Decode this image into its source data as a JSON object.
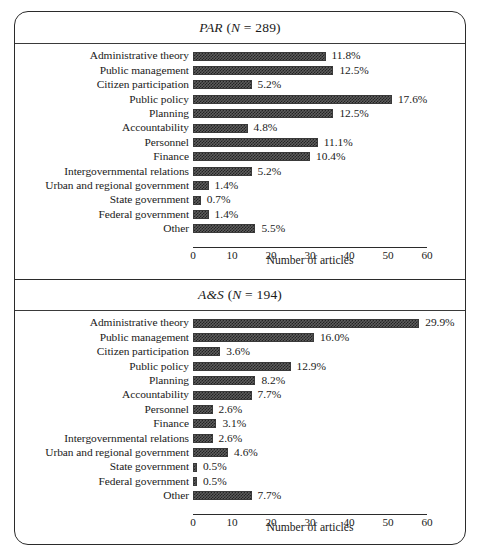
{
  "figure": {
    "background_color": "#ffffff",
    "frame_color": "#2b2b2b",
    "bar_fill_color": "#4a4a4a"
  },
  "panels": [
    {
      "id": "par",
      "title_main": "PAR",
      "title_n": "(N = 289)",
      "axis_title": "Number of articles",
      "tick_labels": [
        "0",
        "10",
        "20",
        "30",
        "40",
        "50",
        "60"
      ]
    },
    {
      "id": "aas",
      "title_main": "A&S",
      "title_n": "(N = 194)",
      "axis_title": "Number of articles",
      "tick_labels": [
        "0",
        "10",
        "20",
        "30",
        "40",
        "50",
        "60"
      ]
    }
  ],
  "chart_data": [
    {
      "type": "bar",
      "orientation": "horizontal",
      "title": "PAR (N = 289)",
      "subtitle": "",
      "xlabel": "Number of articles",
      "ylabel": "",
      "xlim": [
        0,
        60
      ],
      "xticks": [
        0,
        10,
        20,
        30,
        40,
        50,
        60
      ],
      "grid": false,
      "legend": "none",
      "n_total": 289,
      "categories": [
        "Administrative theory",
        "Public management",
        "Citizen participation",
        "Public policy",
        "Planning",
        "Accountability",
        "Personnel",
        "Finance",
        "Intergovernmental relations",
        "Urban and regional government",
        "State government",
        "Federal government",
        "Other"
      ],
      "values": [
        34,
        36,
        15,
        51,
        36,
        14,
        32,
        30,
        15,
        4,
        2,
        4,
        16
      ],
      "data_labels": [
        "11.8%",
        "12.5%",
        "5.2%",
        "17.6%",
        "12.5%",
        "4.8%",
        "11.1%",
        "10.4%",
        "5.2%",
        "1.4%",
        "0.7%",
        "1.4%",
        "5.5%"
      ],
      "percentages": [
        11.8,
        12.5,
        5.2,
        17.6,
        12.5,
        4.8,
        11.1,
        10.4,
        5.2,
        1.4,
        0.7,
        1.4,
        5.5
      ]
    },
    {
      "type": "bar",
      "orientation": "horizontal",
      "title": "A&S (N = 194)",
      "subtitle": "",
      "xlabel": "Number of articles",
      "ylabel": "",
      "xlim": [
        0,
        60
      ],
      "xticks": [
        0,
        10,
        20,
        30,
        40,
        50,
        60
      ],
      "grid": false,
      "legend": "none",
      "n_total": 194,
      "categories": [
        "Administrative theory",
        "Public management",
        "Citizen participation",
        "Public policy",
        "Planning",
        "Accountability",
        "Personnel",
        "Finance",
        "Intergovernmental relations",
        "Urban and regional government",
        "State government",
        "Federal government",
        "Other"
      ],
      "values": [
        58,
        31,
        7,
        25,
        16,
        15,
        5,
        6,
        5,
        9,
        1,
        1,
        15
      ],
      "data_labels": [
        "29.9%",
        "16.0%",
        "3.6%",
        "12.9%",
        "8.2%",
        "7.7%",
        "2.6%",
        "3.1%",
        "2.6%",
        "4.6%",
        "0.5%",
        "0.5%",
        "7.7%"
      ],
      "percentages": [
        29.9,
        16.0,
        3.6,
        12.9,
        8.2,
        7.7,
        2.6,
        3.1,
        2.6,
        4.6,
        0.5,
        0.5,
        7.7
      ]
    }
  ]
}
